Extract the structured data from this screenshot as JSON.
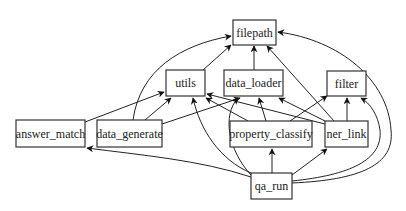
{
  "diagram": {
    "type": "dependency-graph",
    "nodes": [
      {
        "id": "filepath",
        "label": "filepath",
        "x": 233,
        "y": 20,
        "w": 43,
        "h": 25
      },
      {
        "id": "utils",
        "label": "utils",
        "x": 166,
        "y": 70,
        "w": 39,
        "h": 26
      },
      {
        "id": "data_loader",
        "label": "data_loader",
        "x": 224,
        "y": 70,
        "w": 59,
        "h": 26
      },
      {
        "id": "filter",
        "label": "filter",
        "x": 327,
        "y": 71,
        "w": 39,
        "h": 25
      },
      {
        "id": "answer_match",
        "label": "answer_match",
        "x": 16,
        "y": 120,
        "w": 69,
        "h": 27
      },
      {
        "id": "data_generate",
        "label": "data_generate",
        "x": 97,
        "y": 120,
        "w": 65,
        "h": 27
      },
      {
        "id": "property_classify",
        "label": "property_classify",
        "x": 230,
        "y": 121,
        "w": 82,
        "h": 26
      },
      {
        "id": "ner_link",
        "label": "ner_link",
        "x": 325,
        "y": 121,
        "w": 43,
        "h": 26
      },
      {
        "id": "qa_run",
        "label": "qa_run",
        "x": 251,
        "y": 173,
        "w": 41,
        "h": 26
      }
    ],
    "edges": [
      {
        "from": "utils",
        "to": "filepath",
        "path": "M203,70 L231,45"
      },
      {
        "from": "data_loader",
        "to": "filepath",
        "path": "M254,70 L254,46"
      },
      {
        "from": "ner_link",
        "to": "filepath",
        "path": "M334,121 L267,46"
      },
      {
        "from": "data_generate",
        "to": "filepath",
        "path": "M133,120 C140,70 180,45 231,36"
      },
      {
        "from": "qa_run",
        "to": "filepath",
        "path": "M292,183 C360,180 395,165 391,130 C388,80 340,40 278,32"
      },
      {
        "from": "answer_match",
        "to": "utils",
        "path": "M85,122 L164,92"
      },
      {
        "from": "data_generate",
        "to": "utils",
        "path": "M145,120 L171,98"
      },
      {
        "from": "data_generate",
        "to": "data_loader",
        "path": "M162,124 L240,98"
      },
      {
        "from": "property_classify",
        "to": "utils",
        "path": "M248,121 L206,98"
      },
      {
        "from": "ner_link",
        "to": "utils",
        "path": "M325,124 L207,94"
      },
      {
        "from": "qa_run",
        "to": "utils",
        "path": "M251,173 C220,160 200,130 193,98"
      },
      {
        "from": "qa_run",
        "to": "data_loader",
        "path": "M251,175 C228,150 222,115 238,98"
      },
      {
        "from": "property_classify",
        "to": "data_loader",
        "path": "M266,121 L259,98"
      },
      {
        "from": "ner_link",
        "to": "data_loader",
        "path": "M325,121 L279,98"
      },
      {
        "from": "property_classify",
        "to": "filter",
        "path": "M290,121 L327,96"
      },
      {
        "from": "ner_link",
        "to": "filter",
        "path": "M347,121 L347,98"
      },
      {
        "from": "qa_run",
        "to": "filter",
        "path": "M292,181 C350,175 383,160 380,130 C378,115 370,103 361,98"
      },
      {
        "from": "qa_run",
        "to": "property_classify",
        "path": "M272,173 L272,149"
      },
      {
        "from": "qa_run",
        "to": "ner_link",
        "path": "M292,175 L327,149"
      },
      {
        "from": "qa_run",
        "to": "answer_match",
        "path": "M251,177 C200,160 140,155 87,148"
      }
    ]
  }
}
